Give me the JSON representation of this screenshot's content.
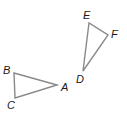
{
  "diagram": {
    "stroke_color": "#8a8a8a",
    "label_color": "#1a1a1a",
    "triangles": [
      {
        "name": "ABC",
        "vertices": [
          {
            "label": "A",
            "x": 57,
            "y": 85,
            "label_x": 61,
            "label_y": 91
          },
          {
            "label": "B",
            "x": 14,
            "y": 73,
            "label_x": 3,
            "label_y": 74
          },
          {
            "label": "C",
            "x": 15,
            "y": 98,
            "label_x": 7,
            "label_y": 109
          }
        ]
      },
      {
        "name": "DEF",
        "vertices": [
          {
            "label": "D",
            "x": 83,
            "y": 71,
            "label_x": 76,
            "label_y": 83
          },
          {
            "label": "E",
            "x": 89,
            "y": 23,
            "label_x": 83,
            "label_y": 19
          },
          {
            "label": "F",
            "x": 108,
            "y": 35,
            "label_x": 111,
            "label_y": 38
          }
        ]
      }
    ]
  }
}
